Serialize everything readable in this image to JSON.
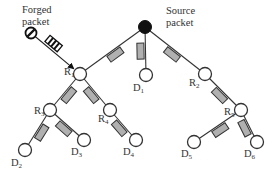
{
  "diagram": {
    "title_labels": {
      "forged": [
        "Forged",
        "packet"
      ],
      "source": [
        "Source",
        "packet"
      ]
    },
    "nodes": [
      {
        "id": "S",
        "type": "source",
        "x": 145,
        "y": 27,
        "r": 6.5,
        "label": ""
      },
      {
        "id": "R1",
        "type": "router",
        "x": 80,
        "y": 74,
        "r": 6.5,
        "label": "R",
        "sub": "1",
        "lx": 64,
        "ly": 75
      },
      {
        "id": "D1",
        "type": "dest",
        "x": 146,
        "y": 75,
        "r": 6.5,
        "label": "D",
        "sub": "1",
        "lx": 133,
        "ly": 91
      },
      {
        "id": "R2",
        "type": "router",
        "x": 205,
        "y": 74,
        "r": 6.5,
        "label": "R",
        "sub": "2",
        "lx": 189,
        "ly": 86
      },
      {
        "id": "R3",
        "type": "router",
        "x": 50,
        "y": 110,
        "r": 6.5,
        "label": "R",
        "sub": "3",
        "lx": 34,
        "ly": 114
      },
      {
        "id": "R4",
        "type": "router",
        "x": 110,
        "y": 110,
        "r": 6.5,
        "label": "R",
        "sub": "4",
        "lx": 98,
        "ly": 122
      },
      {
        "id": "R5",
        "type": "router",
        "x": 241,
        "y": 110,
        "r": 6.5,
        "label": "R",
        "sub": "5",
        "lx": 224,
        "ly": 115
      },
      {
        "id": "D2",
        "type": "dest",
        "x": 25,
        "y": 150,
        "r": 6.5,
        "label": "D",
        "sub": "2",
        "lx": 11,
        "ly": 166
      },
      {
        "id": "D3",
        "type": "dest",
        "x": 84,
        "y": 140,
        "r": 6.5,
        "label": "D",
        "sub": "3",
        "lx": 71,
        "ly": 155
      },
      {
        "id": "D4",
        "type": "dest",
        "x": 136,
        "y": 140,
        "r": 6.5,
        "label": "D",
        "sub": "4",
        "lx": 123,
        "ly": 155
      },
      {
        "id": "D5",
        "type": "dest",
        "x": 194,
        "y": 142,
        "r": 6.5,
        "label": "D",
        "sub": "5",
        "lx": 181,
        "ly": 157
      },
      {
        "id": "D6",
        "type": "dest",
        "x": 257,
        "y": 142,
        "r": 6.5,
        "label": "D",
        "sub": "6",
        "lx": 244,
        "ly": 157
      }
    ],
    "edges": [
      [
        "S",
        "R1"
      ],
      [
        "S",
        "D1"
      ],
      [
        "S",
        "R2"
      ],
      [
        "R1",
        "R3"
      ],
      [
        "R1",
        "R4"
      ],
      [
        "R3",
        "D2"
      ],
      [
        "R3",
        "D3"
      ],
      [
        "R4",
        "D4"
      ],
      [
        "R2",
        "R5"
      ],
      [
        "R5",
        "D5"
      ],
      [
        "R5",
        "D6"
      ]
    ],
    "forged": {
      "attacker_x": 31,
      "attacker_y": 33,
      "target": "R1"
    },
    "colors": {
      "packet_fill": "#b0b0b0",
      "line": "#333333",
      "source_fill": "#111111"
    }
  }
}
